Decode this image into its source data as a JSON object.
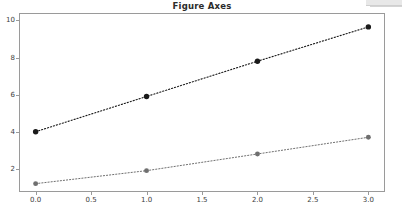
{
  "window": {
    "strip_label": ""
  },
  "chart_data": {
    "type": "line",
    "title": "Figure Axes",
    "xlabel": "",
    "ylabel": "",
    "xlim": [
      -0.15,
      3.15
    ],
    "ylim": [
      0.75,
      10.4
    ],
    "grid": false,
    "legend": null,
    "x": [
      0.0,
      1.0,
      2.0,
      3.0
    ],
    "xticks": [
      0.0,
      0.5,
      1.0,
      1.5,
      2.0,
      2.5,
      3.0
    ],
    "xticklabels": [
      "0.0",
      "0.5",
      "1.0",
      "1.5",
      "2.0",
      "2.5",
      "3.0"
    ],
    "yticks": [
      2,
      4,
      6,
      8,
      10
    ],
    "yticklabels": [
      "2",
      "4",
      "6",
      "8",
      "10"
    ],
    "series": [
      {
        "name": "upper",
        "values": [
          4.0,
          5.9,
          7.8,
          9.65
        ],
        "color": "#1a1a1a",
        "linestyle": "dotted",
        "marker": "o",
        "markersize": 4.2,
        "linewidth": 1.1
      },
      {
        "name": "lower",
        "values": [
          1.2,
          1.9,
          2.8,
          3.7
        ],
        "color": "#6f6f6f",
        "linestyle": "dotted",
        "marker": "o",
        "markersize": 3.8,
        "linewidth": 1.0
      }
    ],
    "colors": {
      "axes_edge": "#9a9a9a",
      "figure_background": "#ffffff",
      "axes_background": "#ffffff",
      "tick_label": "#3d3d3d",
      "title": "#2b2b2b"
    }
  }
}
